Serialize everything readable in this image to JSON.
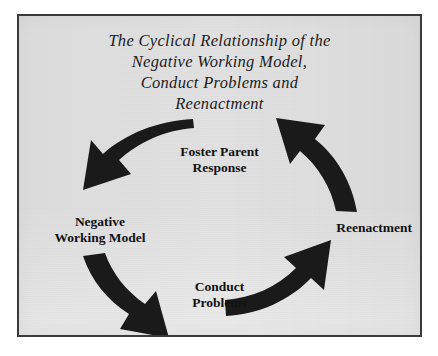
{
  "figure": {
    "title_lines": [
      "The Cyclical Relationship of the",
      "Negative Working Model,",
      "Conduct Problems and",
      "Reenactment"
    ],
    "border_color": "#3a3a3a",
    "panel_background": "#e2e2e2",
    "arrow_color": "#1a1a1a",
    "text_color": "#121212"
  },
  "cycle": {
    "direction": "counterclockwise",
    "nodes": [
      {
        "id": "foster-parent-response",
        "position": "top",
        "lines": [
          "Foster Parent",
          "Response"
        ]
      },
      {
        "id": "negative-working-model",
        "position": "left",
        "lines": [
          "Negative",
          "Working Model"
        ]
      },
      {
        "id": "conduct-problems",
        "position": "bottom",
        "lines": [
          "Conduct",
          "Problems"
        ]
      },
      {
        "id": "reenactment",
        "position": "right",
        "lines": [
          "Reenactment"
        ]
      }
    ],
    "arrows": [
      {
        "id": "arrow-top-left",
        "from": "foster-parent-response",
        "to": "negative-working-model"
      },
      {
        "id": "arrow-bottom-left",
        "from": "negative-working-model",
        "to": "conduct-problems"
      },
      {
        "id": "arrow-bottom-right",
        "from": "conduct-problems",
        "to": "reenactment"
      },
      {
        "id": "arrow-top-right",
        "from": "reenactment",
        "to": "foster-parent-response"
      }
    ]
  }
}
